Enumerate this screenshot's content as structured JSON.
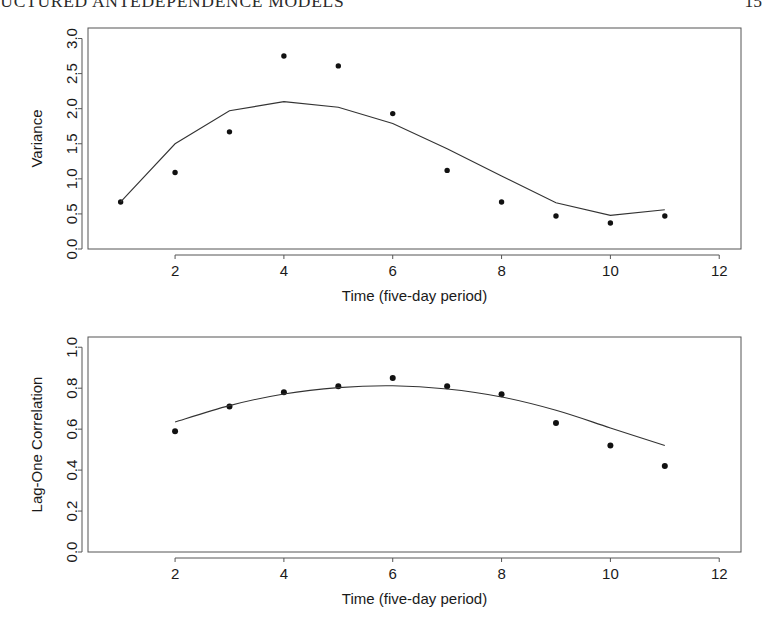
{
  "running_head": {
    "title": "RUCTURED ANTEDEPENDENCE MODELS",
    "page_number": "15"
  },
  "figure": {
    "panel1_name": "variance-panel",
    "panel2_name": "correlation-panel"
  },
  "chart_data": [
    {
      "type": "scatter",
      "title": "",
      "xlabel": "Time (five-day period)",
      "ylabel": "Variance",
      "xlim": [
        0.4,
        12.4
      ],
      "ylim": [
        0.0,
        3.15
      ],
      "xticks": [
        2,
        4,
        6,
        8,
        10,
        12
      ],
      "xtick_labels": [
        "2",
        "4",
        "6",
        "8",
        "10",
        "12"
      ],
      "yticks": [
        0.0,
        0.5,
        1.0,
        1.5,
        2.0,
        2.5,
        3.0
      ],
      "ytick_labels": [
        "0.0",
        "0.5",
        "1.0",
        "1.5",
        "2.0",
        "2.5",
        "3.0"
      ],
      "grid": false,
      "legend": "none",
      "x": [
        1,
        2,
        3,
        4,
        5,
        6,
        7,
        8,
        9,
        10,
        11
      ],
      "values": [
        0.67,
        1.09,
        1.67,
        2.75,
        2.61,
        1.93,
        1.12,
        0.67,
        0.47,
        0.37,
        0.47
      ],
      "series": [
        {
          "name": "observed variance",
          "style": "points",
          "x": [
            1,
            2,
            3,
            4,
            5,
            6,
            7,
            8,
            9,
            10,
            11
          ],
          "values": [
            0.67,
            1.09,
            1.67,
            2.75,
            2.61,
            1.93,
            1.12,
            0.67,
            0.47,
            0.37,
            0.47
          ]
        },
        {
          "name": "fitted variance",
          "style": "line",
          "x": [
            1,
            2,
            3,
            4,
            5,
            6,
            7,
            8,
            9,
            10,
            11
          ],
          "values": [
            0.67,
            1.5,
            1.97,
            2.1,
            2.02,
            1.79,
            1.43,
            1.04,
            0.66,
            0.48,
            0.56
          ]
        }
      ]
    },
    {
      "type": "scatter",
      "title": "",
      "xlabel": "Time (five-day period)",
      "ylabel": "Lag-One Correlation",
      "xlim": [
        0.4,
        12.4
      ],
      "ylim": [
        0.0,
        1.05
      ],
      "xticks": [
        2,
        4,
        6,
        8,
        10,
        12
      ],
      "xtick_labels": [
        "2",
        "4",
        "6",
        "8",
        "10",
        "12"
      ],
      "yticks": [
        0.0,
        0.2,
        0.4,
        0.6,
        0.8,
        1.0
      ],
      "ytick_labels": [
        "0.0",
        "0.2",
        "0.4",
        "0.6",
        "0.8",
        "1.0"
      ],
      "grid": false,
      "legend": "none",
      "x": [
        2,
        3,
        4,
        5,
        6,
        7,
        8,
        9,
        10,
        11
      ],
      "values": [
        0.59,
        0.71,
        0.78,
        0.81,
        0.85,
        0.81,
        0.77,
        0.63,
        0.52,
        0.42
      ],
      "series": [
        {
          "name": "observed lag-one correlation",
          "style": "points",
          "x": [
            2,
            3,
            4,
            5,
            6,
            7,
            8,
            9,
            10,
            11
          ],
          "values": [
            0.59,
            0.71,
            0.78,
            0.81,
            0.85,
            0.81,
            0.77,
            0.63,
            0.52,
            0.42
          ]
        },
        {
          "name": "fitted lag-one correlation",
          "style": "line",
          "x": [
            2,
            3,
            4,
            5,
            6,
            7,
            8,
            9,
            10,
            11
          ],
          "values": [
            0.635,
            0.715,
            0.772,
            0.803,
            0.812,
            0.796,
            0.757,
            0.692,
            0.606,
            0.52
          ]
        }
      ]
    }
  ]
}
